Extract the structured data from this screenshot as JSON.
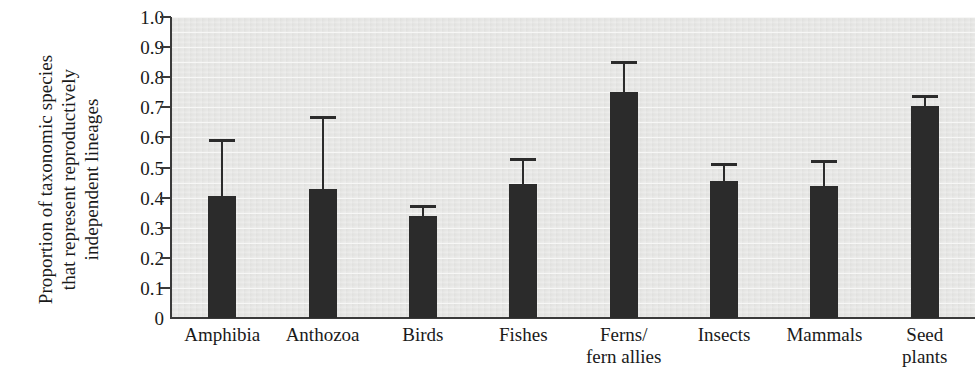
{
  "chart_data": {
    "type": "bar",
    "title": "",
    "xlabel": "",
    "ylabel_lines": [
      "Proportion of taxonomic species",
      "that represent reproductively",
      "independent lineages"
    ],
    "ylabel": "Proportion of taxonomic species that represent reproductively independent lineages",
    "ylim": [
      0,
      1.0
    ],
    "ytick_labels": [
      "1.0",
      "0.9",
      "0.8",
      "0.7",
      "0.6",
      "0.5",
      "0.4",
      "0.3",
      "0.2",
      "0.1",
      "0"
    ],
    "ytick_values": [
      1.0,
      0.9,
      0.8,
      0.7,
      0.6,
      0.5,
      0.4,
      0.3,
      0.2,
      0.1,
      0
    ],
    "grid": true,
    "grid_interval": 0.05,
    "legend": "none",
    "error_bars": "upper only",
    "categories": [
      "Amphibia",
      "Anthozoa",
      "Birds",
      "Fishes",
      "Ferns/\nfern allies",
      "Insects",
      "Mammals",
      "Seed\nplants"
    ],
    "category_labels": [
      [
        "Amphibia"
      ],
      [
        "Anthozoa"
      ],
      [
        "Birds"
      ],
      [
        "Fishes"
      ],
      [
        "Ferns/",
        "fern allies"
      ],
      [
        "Insects"
      ],
      [
        "Mammals"
      ],
      [
        "Seed",
        "plants"
      ]
    ],
    "values": [
      0.405,
      0.43,
      0.34,
      0.445,
      0.75,
      0.455,
      0.44,
      0.705
    ],
    "error_upper": [
      0.595,
      0.67,
      0.375,
      0.53,
      0.855,
      0.515,
      0.525,
      0.74
    ],
    "colors": {
      "bar": "#2b2b2b",
      "plot_background": "#e8e8e6",
      "gridline": "#f7f7f6",
      "axis": "#3a3a3a",
      "page_background": "#ffffff",
      "text": "#1a1a1a"
    }
  }
}
